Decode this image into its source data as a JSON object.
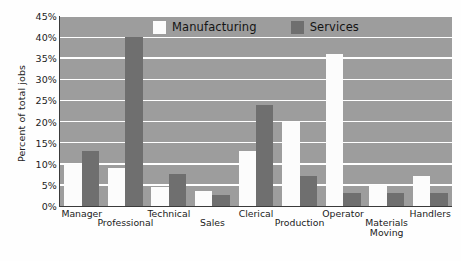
{
  "chart_data": {
    "type": "bar",
    "title": "",
    "xlabel": "",
    "ylabel": "Percent of total jobs",
    "ylim": [
      0,
      45
    ],
    "ytick_labels": [
      "0%",
      "5%",
      "10%",
      "15%",
      "20%",
      "25%",
      "30%",
      "35%",
      "40%",
      "45%"
    ],
    "ytick_values": [
      0,
      5,
      10,
      15,
      20,
      25,
      30,
      35,
      40,
      45
    ],
    "grid": true,
    "grid_axis": "y",
    "legend_position": "top-center",
    "categories": [
      "Manager",
      "Professional",
      "Technical",
      "Sales",
      "Clerical",
      "Production",
      "Operator",
      "Materials\nMoving",
      "Handlers"
    ],
    "series": [
      {
        "name": "Manufacturing",
        "color": "#fcfcfc",
        "values": [
          10,
          9,
          4.5,
          3.5,
          13,
          20,
          36,
          5,
          7
        ]
      },
      {
        "name": "Services",
        "color": "#6f6f6f",
        "values": [
          13,
          40,
          7.5,
          2.5,
          24,
          7,
          3,
          3,
          3
        ]
      }
    ],
    "plot_background": "#9d9d9d",
    "gridline_color": "#ffffff",
    "axis_color": "#3a3a3a"
  }
}
